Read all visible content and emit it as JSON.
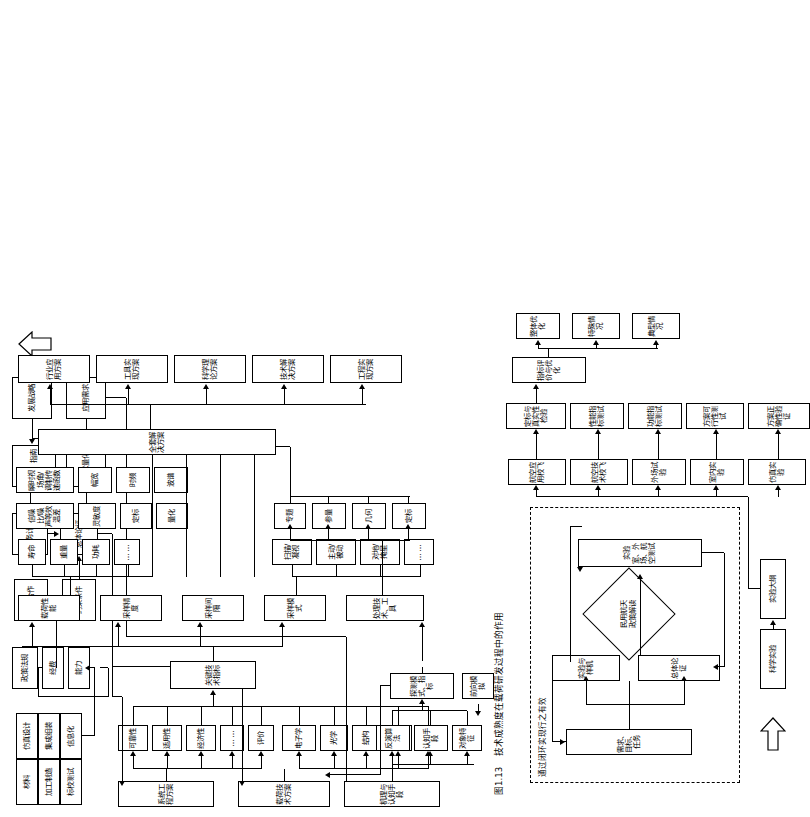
{
  "figure": {
    "caption_number": "图1.13",
    "caption_text": "技术成熟度在载荷研发过程中的作用"
  },
  "diagram": {
    "title_note": "载荷研发过程技术成熟度流程图",
    "upper": {
      "capability_grid": {
        "row_top": [
          "材料",
          "加工制造",
          "标校测试"
        ],
        "row_bottom": [
          "仿真设计",
          "集成组装",
          "信息化"
        ]
      },
      "resources": [
        "政策法规",
        "经费",
        "能力"
      ],
      "inputs": [
        "国际合作",
        "约束条件"
      ],
      "planning": [
        "任务计划",
        "总体论证",
        "规划，指南",
        "需求量化",
        "发展战略",
        "应用需求"
      ],
      "system_engineering": {
        "label": "系统工程方案",
        "children": [
          "可靠性",
          "适用性",
          "经济性",
          "……",
          "评价"
        ]
      },
      "payload_tech": {
        "label": "载荷技术方案",
        "children": [
          "电子学",
          "光学",
          "结构",
          "热控",
          "……"
        ]
      },
      "mechanism": {
        "label": "机理与认知手段",
        "children": [
          "对象特征",
          "认知手段",
          "反演算法"
        ],
        "forward_model": "前向模拟",
        "detection": "探测模式、指标"
      },
      "key_indicator": "关键技术指标",
      "groups": [
        {
          "label": "载荷性能",
          "children": [
            "寿命",
            "重量",
            "功耗",
            "……"
          ]
        },
        {
          "label": "采样精度",
          "children": [
            "信噪比/噪声等效温差",
            "灵敏度",
            "定标",
            "量化"
          ]
        },
        {
          "label": "采样间隔",
          "children": [
            "瞬时视场角/调制传递函数",
            "幅宽",
            "时频",
            "波谱"
          ]
        },
        {
          "label": "采样模式",
          "children": [
            "扫描/凝视",
            "主动/被动",
            "对地/掩星",
            "……"
          ]
        },
        {
          "label": "处理技术、工具",
          "children": [
            "定标",
            "几何",
            "参量",
            "专题"
          ]
        }
      ],
      "full_solution": {
        "label": "全套解决方案",
        "children": [
          "行业应用方案",
          "工具实现方案",
          "科学理论方案",
          "技术解决方案",
          "工程实现方案"
        ]
      }
    },
    "lower": {
      "closed_loop": {
        "dashed_label": "通过闭环实现行之有效",
        "requirement": "需求、目标、任务",
        "overall": "总体论证",
        "experiment": "实验与样机",
        "lab": "实验室、外场、航空测试",
        "diamond": "民用航天\n政策解读"
      },
      "experiment_flow": {
        "source": "科学实验",
        "outline": "实验大纲",
        "pairs": [
          {
            "test": "仿真实验",
            "result": "方案正确性验证"
          },
          {
            "test": "室内实验",
            "result": "方案可行性测试"
          },
          {
            "test": "外场试验",
            "result": "功能指标测试"
          },
          {
            "test": "航空技术校飞",
            "result": "性能指标测试"
          },
          {
            "test": "航空应用校飞",
            "result": "定标与真实性检验"
          }
        ],
        "evaluation": "指标评价与优化",
        "outcomes": [
          "整体优化",
          "特殊情况",
          "典型情况"
        ]
      }
    }
  }
}
